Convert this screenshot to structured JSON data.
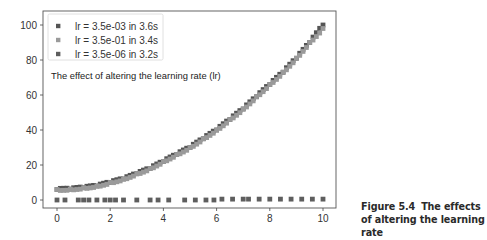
{
  "figure": {
    "caption_label": "Figure 5.4",
    "caption_text": "The effects of altering the learning rate"
  },
  "chart_data": {
    "type": "scatter",
    "title": "",
    "annotation": "The effect of altering the learning rate (lr)",
    "xlabel": "",
    "ylabel": "",
    "xlim": [
      -0.5,
      10.5
    ],
    "ylim": [
      -5,
      108
    ],
    "x_ticks": [
      0,
      2,
      4,
      6,
      8,
      10
    ],
    "y_ticks": [
      0,
      20,
      40,
      60,
      80,
      100
    ],
    "grid": false,
    "legend_position": "upper left",
    "series": [
      {
        "name": "lr = 3.5e-03 in 3.6s",
        "color": "#555555",
        "x": [
          0.0,
          0.5,
          1.0,
          1.5,
          2.0,
          2.5,
          3.0,
          3.5,
          4.0,
          4.5,
          5.0,
          5.5,
          6.0,
          6.5,
          7.0,
          7.5,
          8.0,
          8.5,
          9.0,
          9.5,
          10.0
        ],
        "y": [
          6,
          6.2,
          7,
          8,
          10,
          12,
          15,
          18,
          22,
          26,
          30,
          35,
          40,
          46,
          52,
          59,
          66,
          73,
          81,
          90,
          100
        ]
      },
      {
        "name": "lr = 3.5e-01 in 3.4s",
        "color": "#9a9a9a",
        "x": [
          0.0,
          0.5,
          1.0,
          1.5,
          2.0,
          2.5,
          3.0,
          3.5,
          4.0,
          4.5,
          5.0,
          5.5,
          6.0,
          6.5,
          7.0,
          7.5,
          8.0,
          8.5,
          9.0,
          9.5,
          10.0
        ],
        "y": [
          6,
          6.2,
          7,
          8,
          10,
          12,
          15,
          18,
          22,
          26,
          30,
          35,
          40,
          46,
          52,
          59,
          66,
          73,
          81,
          90,
          98
        ]
      },
      {
        "name": "lr = 3.5e-06 in 3.2s",
        "color": "#5e5e5e",
        "x": [
          0.0,
          0.3,
          0.8,
          1.0,
          1.2,
          1.5,
          1.8,
          2.0,
          2.2,
          2.5,
          3.0,
          3.5,
          3.8,
          4.2,
          4.8,
          5.2,
          5.6,
          5.9,
          6.2,
          6.6,
          7.0,
          7.2,
          7.6,
          8.0,
          8.4,
          8.8,
          9.2,
          9.6,
          10.0
        ],
        "y": [
          0,
          0,
          0,
          0,
          0,
          0,
          0,
          0,
          0,
          0,
          0,
          0,
          0,
          0,
          0,
          0,
          0,
          0,
          0.5,
          0.5,
          0.5,
          0.5,
          0.5,
          0.5,
          0.5,
          0.5,
          0.5,
          0.5,
          0.5
        ]
      }
    ]
  }
}
